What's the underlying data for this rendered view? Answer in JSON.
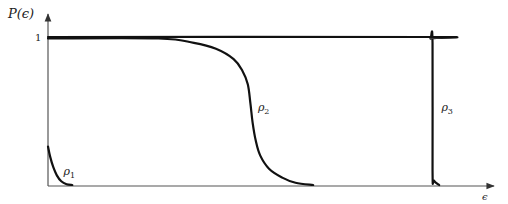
{
  "chart_data": {
    "type": "line",
    "title": "",
    "ylabel": "P(ϵ)",
    "xlabel": "ϵ",
    "yticks": [
      {
        "value": 1,
        "label": "1"
      }
    ],
    "xlim": [
      0,
      1
    ],
    "ylim": [
      0,
      1
    ],
    "grid": false,
    "legend": "none (inline curve labels)",
    "series": [
      {
        "name": "ρ1",
        "label": "ρ",
        "subscript": "1",
        "points": [
          [
            0.0,
            0.26
          ],
          [
            0.005,
            0.19
          ],
          [
            0.012,
            0.12
          ],
          [
            0.02,
            0.065
          ],
          [
            0.03,
            0.025
          ],
          [
            0.042,
            0.005
          ],
          [
            0.055,
            0.0
          ]
        ],
        "label_at": [
          0.035,
          0.07
        ]
      },
      {
        "name": "ρ2",
        "label": "ρ",
        "subscript": "2",
        "points": [
          [
            0.0,
            0.99
          ],
          [
            0.25,
            0.99
          ],
          [
            0.33,
            0.96
          ],
          [
            0.38,
            0.92
          ],
          [
            0.42,
            0.85
          ],
          [
            0.44,
            0.77
          ],
          [
            0.452,
            0.68
          ],
          [
            0.458,
            0.55
          ],
          [
            0.463,
            0.42
          ],
          [
            0.47,
            0.3
          ],
          [
            0.48,
            0.2
          ],
          [
            0.5,
            0.11
          ],
          [
            0.53,
            0.05
          ],
          [
            0.56,
            0.015
          ],
          [
            0.6,
            0.0
          ]
        ],
        "label_at": [
          0.475,
          0.5
        ]
      },
      {
        "name": "ρ3",
        "label": "ρ",
        "subscript": "3",
        "points": [
          [
            0.0,
            1.0
          ],
          [
            0.855,
            1.0
          ],
          [
            0.865,
            0.99
          ],
          [
            0.87,
            0.96
          ],
          [
            0.87,
            0.1
          ],
          [
            0.873,
            0.03
          ],
          [
            0.885,
            0.0
          ]
        ],
        "label_at": [
          0.89,
          0.5
        ]
      }
    ]
  }
}
